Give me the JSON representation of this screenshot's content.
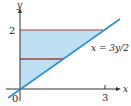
{
  "diagram": {
    "axes": {
      "x_label": "x",
      "y_label": "y",
      "origin_label": "0",
      "x_tick": "3",
      "y_tick": "2"
    },
    "curve_label": "x = 3y/2",
    "colors": {
      "region_fill": "#bfe0f3",
      "boundary_line": "#2b8fd0",
      "segment": "#a2453a",
      "axis": "#333333"
    },
    "region": {
      "description": "region between y-axis and x = 3y/2 for 0 ≤ y ≤ 2"
    }
  }
}
